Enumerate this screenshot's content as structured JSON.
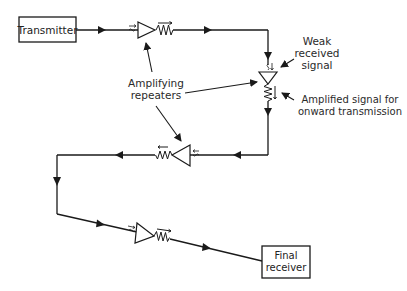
{
  "diagram": {
    "nodes": {
      "transmitter": "Transmitter",
      "final_receiver_line1": "Final",
      "final_receiver_line2": "receiver"
    },
    "labels": {
      "repeaters_line1": "Amplifying",
      "repeaters_line2": "repeaters",
      "weak_line1": "Weak",
      "weak_line2": "received",
      "weak_line3": "signal",
      "amplified_line1": "Amplified signal for",
      "amplified_line2": "onward transmission"
    },
    "repeater_count": 4,
    "colors": {
      "line": "#1a1a1a",
      "text": "#2a2a2a",
      "background": "#ffffff"
    }
  }
}
